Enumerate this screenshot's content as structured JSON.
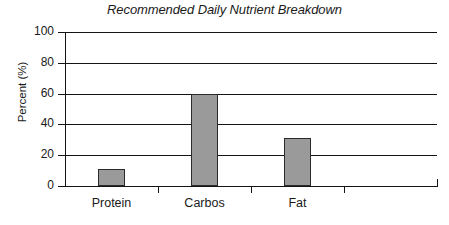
{
  "chart_data": {
    "type": "bar",
    "title": "Recommended Daily Nutrient Breakdown",
    "xlabel": "",
    "ylabel": "Percent (%)",
    "categories": [
      "Protein",
      "Carbos",
      "Fat"
    ],
    "values": [
      11,
      60,
      31
    ],
    "ylim": [
      0,
      100
    ],
    "yticks": [
      0,
      20,
      40,
      60,
      80,
      100
    ],
    "ytick_labels": [
      "0",
      "20",
      "40",
      "60",
      "80",
      "100"
    ],
    "grid": "horizontal",
    "legend": "none",
    "bar_color": "#9a9a9a",
    "bar_edge_color": "#2b2b2b",
    "axis_color": "#141414",
    "background_color": "#ffffff",
    "title_style": "italic",
    "x_tick_slots": 4,
    "annotations": []
  }
}
